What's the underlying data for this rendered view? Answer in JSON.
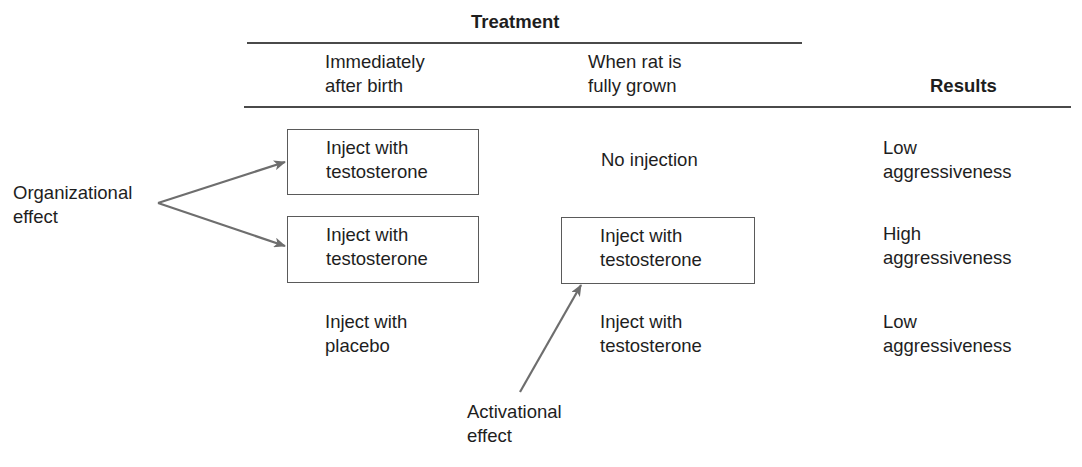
{
  "header": {
    "group_title": "Treatment",
    "columns": [
      {
        "line1": "Immediately",
        "line2": "after birth"
      },
      {
        "line1": "When rat is",
        "line2": "fully grown"
      }
    ],
    "results_title": "Results"
  },
  "rows": [
    {
      "after_birth": {
        "line1": "Inject with",
        "line2": "testosterone",
        "boxed": true
      },
      "fully_grown": {
        "line1": "No injection",
        "line2": "",
        "boxed": false
      },
      "result": {
        "line1": "Low",
        "line2": "aggressiveness"
      }
    },
    {
      "after_birth": {
        "line1": "Inject with",
        "line2": "testosterone",
        "boxed": true
      },
      "fully_grown": {
        "line1": "Inject with",
        "line2": "testosterone",
        "boxed": true
      },
      "result": {
        "line1": "High",
        "line2": "aggressiveness"
      }
    },
    {
      "after_birth": {
        "line1": "Inject with",
        "line2": "placebo",
        "boxed": false
      },
      "fully_grown": {
        "line1": "Inject with",
        "line2": "testosterone",
        "boxed": false
      },
      "result": {
        "line1": "Low",
        "line2": "aggressiveness"
      }
    }
  ],
  "annotations": {
    "organizational": {
      "line1": "Organizational",
      "line2": "effect"
    },
    "activational": {
      "line1": "Activational",
      "line2": "effect"
    }
  },
  "colors": {
    "text": "#1e1e1e",
    "rule": "#4a4a4a",
    "box_border": "#5a5a5a",
    "arrow": "#6e6e6e"
  }
}
